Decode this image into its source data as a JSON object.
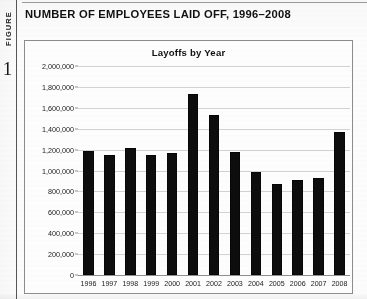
{
  "figure": {
    "word": "FIGURE",
    "number": "1"
  },
  "page_title": "NUMBER OF EMPLOYEES LAID OFF, 1996–2008",
  "chart_data": {
    "type": "bar",
    "title": "Layoffs by Year",
    "xlabel": "",
    "ylabel": "",
    "categories": [
      "1996",
      "1997",
      "1998",
      "1999",
      "2000",
      "2001",
      "2002",
      "2003",
      "2004",
      "2005",
      "2006",
      "2007",
      "2008"
    ],
    "values": [
      1185000,
      1150000,
      1220000,
      1150000,
      1165000,
      1730000,
      1530000,
      1180000,
      990000,
      870000,
      910000,
      930000,
      1365000
    ],
    "ylim": [
      0,
      2000000
    ],
    "ytick_values": [
      0,
      200000,
      400000,
      600000,
      800000,
      1000000,
      1200000,
      1400000,
      1600000,
      1800000,
      2000000
    ],
    "ytick_labels": [
      "0",
      "200,000",
      "400,000",
      "600,000",
      "800,000",
      "1,000,000",
      "1,200,000",
      "1,400,000",
      "1,600,000",
      "1,800,000",
      "2,000,000"
    ],
    "grid": true,
    "legend": false,
    "bar_color": "#0d0d0d",
    "grid_color": "#d2d2d2",
    "axis_color": "#8f8f8f"
  }
}
